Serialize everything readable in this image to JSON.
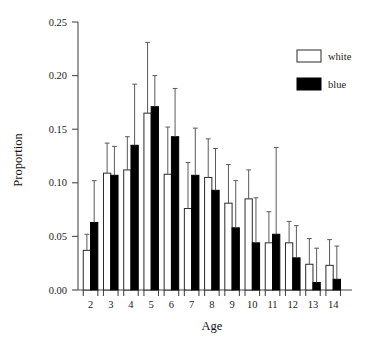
{
  "chart_data": {
    "type": "bar",
    "title": "",
    "xlabel": "Age",
    "ylabel": "Proportion",
    "categories": [
      "2",
      "3",
      "4",
      "5",
      "6",
      "7",
      "8",
      "9",
      "10",
      "11",
      "12",
      "13",
      "14"
    ],
    "ylim": [
      0.0,
      0.25
    ],
    "ytick_labels": [
      "0.00",
      "0.05",
      "0.10",
      "0.15",
      "0.20",
      "0.25"
    ],
    "ytick_values": [
      0.0,
      0.05,
      0.1,
      0.15,
      0.2,
      0.25
    ],
    "grid": false,
    "legend_position": "top-right",
    "series": [
      {
        "name": "white",
        "color": "#ffffff",
        "values": [
          0.037,
          0.109,
          0.112,
          0.165,
          0.108,
          0.076,
          0.105,
          0.081,
          0.085,
          0.044,
          0.044,
          0.024,
          0.023
        ],
        "err_upper": [
          0.052,
          0.137,
          0.143,
          0.231,
          0.152,
          0.119,
          0.141,
          0.117,
          0.112,
          0.073,
          0.064,
          0.048,
          0.047
        ]
      },
      {
        "name": "blue",
        "color": "#000000",
        "values": [
          0.063,
          0.107,
          0.135,
          0.171,
          0.143,
          0.107,
          0.093,
          0.058,
          0.044,
          0.052,
          0.03,
          0.007,
          0.01
        ],
        "err_upper": [
          0.102,
          0.134,
          0.192,
          0.2,
          0.188,
          0.151,
          0.132,
          0.102,
          0.086,
          0.133,
          0.06,
          0.039,
          0.041
        ]
      }
    ]
  },
  "legend": {
    "items": [
      {
        "label": "white"
      },
      {
        "label": "blue"
      }
    ]
  }
}
